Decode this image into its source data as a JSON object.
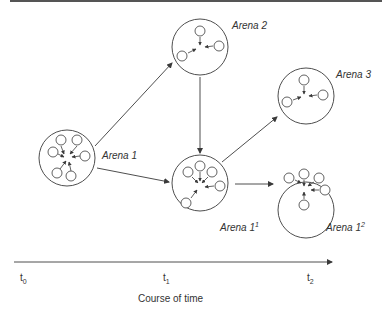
{
  "diagram": {
    "type": "state-transition-over-time",
    "arenas": [
      {
        "id": "arena1",
        "label": "Arena 1",
        "superscript": "",
        "cx": 67,
        "cy": 158,
        "r": 28,
        "label_x": 102,
        "label_y": 150,
        "members": [
          [
            61,
            140
          ],
          [
            77,
            140
          ],
          [
            85,
            156
          ],
          [
            53,
            152
          ],
          [
            57,
            173
          ],
          [
            71,
            176
          ]
        ],
        "arrows": [
          [
            61,
            146,
            64,
            154
          ],
          [
            77,
            146,
            70,
            154
          ],
          [
            80,
            156,
            72,
            157
          ],
          [
            58,
            154,
            64,
            157
          ],
          [
            60,
            169,
            66,
            161
          ],
          [
            71,
            171,
            69,
            162
          ]
        ]
      },
      {
        "id": "arena2",
        "label": "Arena 2",
        "superscript": "",
        "cx": 200,
        "cy": 47,
        "r": 28,
        "label_x": 232,
        "label_y": 20,
        "members": [
          [
            200,
            31
          ],
          [
            219,
            46
          ],
          [
            182,
            56
          ]
        ],
        "arrows": [
          [
            200,
            37,
            200,
            45
          ],
          [
            213,
            46,
            205,
            47
          ],
          [
            188,
            53,
            196,
            49
          ]
        ]
      },
      {
        "id": "arena1_1",
        "label": "Arena 1",
        "superscript": "1",
        "cx": 200,
        "cy": 183,
        "r": 28,
        "label_x": 220,
        "label_y": 222,
        "members": [
          [
            188,
            172
          ],
          [
            200,
            166
          ],
          [
            212,
            172
          ],
          [
            220,
            186
          ],
          [
            186,
            203
          ]
        ],
        "arrows": [
          [
            192,
            177,
            198,
            183
          ],
          [
            200,
            172,
            200,
            181
          ],
          [
            208,
            177,
            202,
            183
          ],
          [
            214,
            186,
            205,
            187
          ],
          [
            191,
            198,
            197,
            190
          ]
        ]
      },
      {
        "id": "arena3",
        "label": "Arena 3",
        "superscript": "",
        "cx": 306,
        "cy": 96,
        "r": 28,
        "label_x": 336,
        "label_y": 69,
        "members": [
          [
            304,
            80
          ],
          [
            323,
            95
          ],
          [
            287,
            102
          ]
        ],
        "arrows": [
          [
            304,
            86,
            304,
            94
          ],
          [
            317,
            95,
            309,
            96
          ],
          [
            293,
            100,
            301,
            97
          ]
        ]
      },
      {
        "id": "arena1_2",
        "label": "Arena 1",
        "superscript": "2",
        "cx": 306,
        "cy": 210,
        "r": 28,
        "label_x": 326,
        "label_y": 222,
        "members": [
          [
            289,
            178
          ],
          [
            304,
            174
          ],
          [
            319,
            178
          ],
          [
            325,
            190
          ],
          [
            304,
            205
          ]
        ],
        "arrows": [
          [
            295,
            180,
            301,
            183
          ],
          [
            304,
            180,
            304,
            186
          ],
          [
            314,
            182,
            308,
            186
          ],
          [
            319,
            190,
            311,
            190
          ],
          [
            304,
            199,
            304,
            192
          ]
        ]
      }
    ],
    "transitions": [
      {
        "from": "Arena 1",
        "to": "Arena 2",
        "x1": 95,
        "y1": 146,
        "x2": 172,
        "y2": 63
      },
      {
        "from": "Arena 1",
        "to": "Arena 1¹",
        "x1": 97,
        "y1": 168,
        "x2": 169,
        "y2": 182
      },
      {
        "from": "Arena 2",
        "to": "Arena 1¹",
        "x1": 200,
        "y1": 77,
        "x2": 200,
        "y2": 153
      },
      {
        "from": "Arena 1¹",
        "to": "Arena 3",
        "x1": 222,
        "y1": 162,
        "x2": 277,
        "y2": 117
      },
      {
        "from": "Arena 1¹",
        "to": "Arena 1²",
        "x1": 235,
        "y1": 184,
        "x2": 273,
        "y2": 184
      }
    ],
    "time_axis": {
      "x1": 14,
      "x2": 332,
      "y": 262,
      "ticks": [
        {
          "base": "t",
          "sub": "0",
          "x": 20,
          "y": 272
        },
        {
          "base": "t",
          "sub": "1",
          "x": 163,
          "y": 272
        },
        {
          "base": "t",
          "sub": "2",
          "x": 307,
          "y": 272
        }
      ],
      "label": "Course of time",
      "label_x": 138,
      "label_y": 293
    },
    "colors": {
      "line": "#3a3a3a",
      "text": "#333333",
      "top_rule": "#555555",
      "background": "#ffffff"
    }
  }
}
